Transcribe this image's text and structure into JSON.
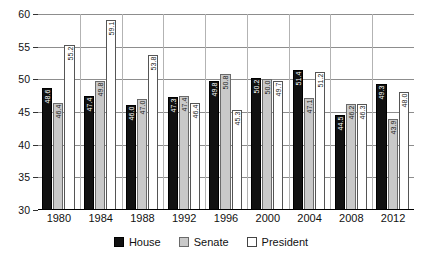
{
  "chart_data": {
    "type": "bar",
    "title": "",
    "subtitle": "",
    "xlabel": "",
    "ylabel": "",
    "ylim": [
      30,
      60
    ],
    "yticks": [
      30,
      35,
      40,
      45,
      50,
      55,
      60
    ],
    "ytick_labels": [
      "30",
      "35",
      "40",
      "45",
      "50",
      "55",
      "60"
    ],
    "grid": true,
    "legend_position": "bottom",
    "categories": [
      "1980",
      "1984",
      "1988",
      "1992",
      "1996",
      "2000",
      "2004",
      "2008",
      "2012"
    ],
    "series": [
      {
        "name": "House",
        "color": "#111111",
        "values": [
          48.6,
          47.4,
          46.0,
          47.3,
          49.8,
          50.2,
          51.4,
          44.5,
          49.3
        ]
      },
      {
        "name": "Senate",
        "color": "#c9c9c9",
        "values": [
          46.4,
          49.8,
          47.0,
          47.4,
          50.8,
          50.0,
          47.1,
          46.2,
          43.9
        ]
      },
      {
        "name": "President",
        "color": "#ffffff",
        "values": [
          55.2,
          59.1,
          53.8,
          46.4,
          45.3,
          49.7,
          51.2,
          46.3,
          48.0
        ]
      }
    ]
  }
}
